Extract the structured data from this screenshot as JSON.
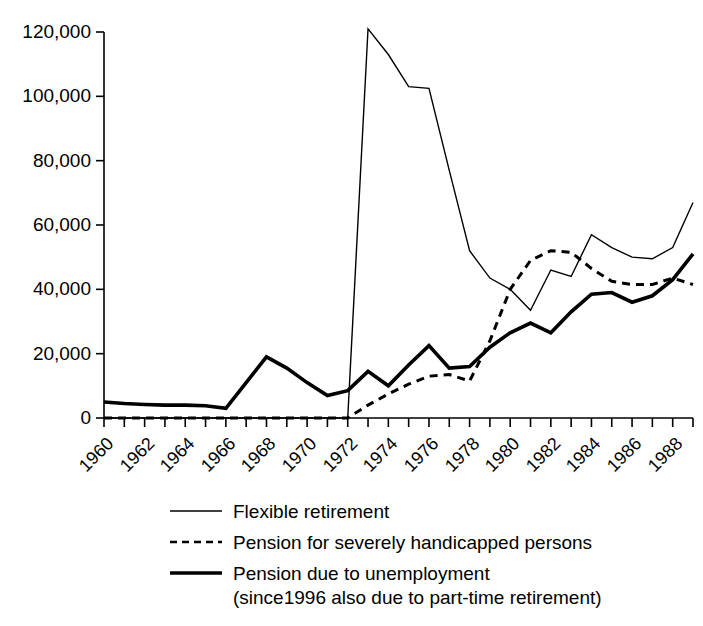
{
  "chart_data": {
    "type": "line",
    "title": "",
    "subtitle": "",
    "xlabel": "",
    "ylabel": "",
    "xlim": [
      1960,
      1989
    ],
    "ylim": [
      0,
      120000
    ],
    "grid": false,
    "legend_position": "bottom",
    "y_ticks": [
      0,
      20000,
      40000,
      60000,
      80000,
      100000,
      120000
    ],
    "y_tick_labels": [
      "0",
      "20,000",
      "40,000",
      "60,000",
      "80,000",
      "100,000",
      "120,000"
    ],
    "x_ticks_labeled": [
      1960,
      1962,
      1964,
      1966,
      1968,
      1970,
      1972,
      1974,
      1976,
      1978,
      1980,
      1982,
      1984,
      1986,
      1988
    ],
    "x_tick_labels": [
      "1960",
      "1962",
      "1964",
      "1966",
      "1968",
      "1970",
      "1972",
      "1974",
      "1976",
      "1978",
      "1980",
      "1982",
      "1984",
      "1986",
      "1988"
    ],
    "x_minor_tick_step": 1,
    "x": [
      1960,
      1961,
      1962,
      1963,
      1964,
      1965,
      1966,
      1967,
      1968,
      1969,
      1970,
      1971,
      1972,
      1973,
      1974,
      1975,
      1976,
      1977,
      1978,
      1979,
      1980,
      1981,
      1982,
      1983,
      1984,
      1985,
      1986,
      1987,
      1988,
      1989
    ],
    "series": [
      {
        "name": "Flexible retirement",
        "style": "thin-solid",
        "color": "#000000",
        "values": [
          0,
          0,
          0,
          0,
          0,
          0,
          0,
          0,
          0,
          0,
          0,
          0,
          0,
          121000,
          113000,
          103000,
          102500,
          77000,
          52000,
          43500,
          40000,
          33500,
          46000,
          44000,
          57000,
          53000,
          50000,
          49500,
          53000,
          67000
        ]
      },
      {
        "name": "Pension for severely handicapped persons",
        "style": "dashed",
        "color": "#000000",
        "values": [
          0,
          0,
          0,
          0,
          0,
          0,
          0,
          0,
          0,
          0,
          0,
          0,
          0,
          4000,
          7500,
          10500,
          13000,
          13500,
          11500,
          24000,
          40000,
          49000,
          52000,
          51500,
          46500,
          42500,
          41500,
          41500,
          43500,
          41500
        ]
      },
      {
        "name": "Pension due to unemployment (since1996 also due to part-time retirement)",
        "style": "thick-solid",
        "color": "#000000",
        "values": [
          5000,
          4500,
          4200,
          4000,
          4000,
          3800,
          3000,
          11000,
          19000,
          15500,
          11000,
          7000,
          8500,
          14500,
          10000,
          16500,
          22500,
          15500,
          16000,
          22000,
          26500,
          29500,
          26500,
          33000,
          38500,
          39000,
          36000,
          38000,
          43000,
          51000
        ]
      }
    ]
  },
  "legend": {
    "items": [
      {
        "label": "Flexible retirement",
        "sublabel": "",
        "style": "thin-solid"
      },
      {
        "label": "Pension for severely handicapped persons",
        "sublabel": "",
        "style": "dashed"
      },
      {
        "label": "Pension due to unemployment",
        "sublabel": "(since1996 also due to part-time retirement)",
        "style": "thick-solid"
      }
    ]
  },
  "axis": {
    "y_labels": [
      "120,000",
      "100,000",
      "80,000",
      "60,000",
      "40,000",
      "20,000",
      "0"
    ],
    "x_labels": [
      "1960",
      "1962",
      "1964",
      "1966",
      "1968",
      "1970",
      "1972",
      "1974",
      "1976",
      "1978",
      "1980",
      "1982",
      "1984",
      "1986",
      "1988"
    ]
  },
  "colors": {
    "ink": "#000000",
    "background": "#ffffff"
  }
}
